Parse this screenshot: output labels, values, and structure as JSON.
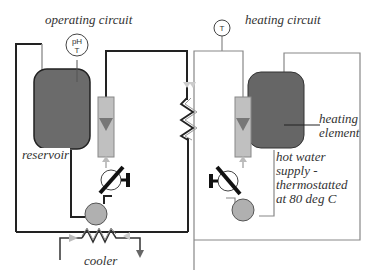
{
  "diagram": {
    "title_left": "operating circuit",
    "title_right": "heating circuit",
    "labels": {
      "reservoir": "reservoir",
      "cooler": "cooler",
      "heating_element_line1": "heating",
      "heating_element_line2": "element",
      "hot_water_line1": "hot water",
      "hot_water_line2": "supply -",
      "hot_water_line3": "thermostatted",
      "hot_water_line4": "at 80 deg C"
    },
    "gauges": {
      "ph_t_line1": "pH",
      "ph_t_line2": "T",
      "t": "T"
    },
    "colors": {
      "operating_line": "#222222",
      "heating_line": "#888888",
      "tank_fill": "#6b6b6b",
      "pump_fill": "#b0b0b0",
      "flowmeter_fill": "#c0c0c0",
      "flowmeter_arrow": "#707070",
      "valve_handle": "#111111"
    }
  }
}
